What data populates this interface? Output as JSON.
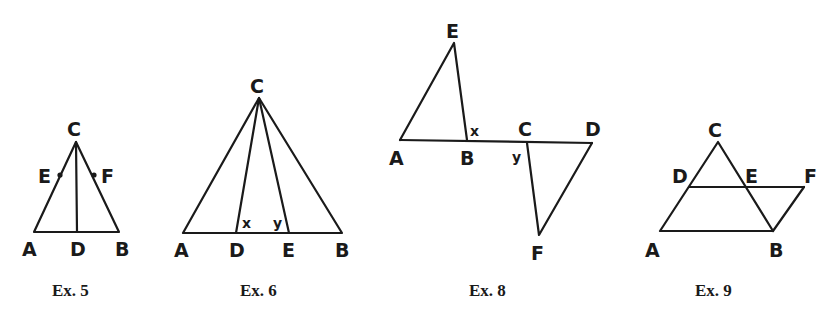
{
  "figures": [
    {
      "caption": "Ex. 5",
      "points": {
        "A": "A",
        "B": "B",
        "C": "C",
        "D": "D",
        "E": "E",
        "F": "F"
      },
      "description": "Isosceles triangle ABC with altitude CD; E and F marked on sides AC and BC"
    },
    {
      "caption": "Ex. 6",
      "points": {
        "A": "A",
        "B": "B",
        "C": "C",
        "D": "D",
        "E": "E"
      },
      "angles": {
        "x": "x",
        "y": "y"
      },
      "description": "Triangle ABC with cevians CD and CE; angles x at D and y at E"
    },
    {
      "caption": "Ex. 8",
      "points": {
        "A": "A",
        "B": "B",
        "C": "C",
        "D": "D",
        "E": "E",
        "F": "F"
      },
      "angles": {
        "x": "x",
        "y": "y"
      },
      "description": "Line ABCD with triangle ABE above and triangle CDF below; angle x at B, angle y at C"
    },
    {
      "caption": "Ex. 9",
      "points": {
        "A": "A",
        "B": "B",
        "C": "C",
        "D": "D",
        "E": "E",
        "F": "F"
      },
      "description": "Triangle ABC with DF parallel to AB crossing CB at E; BF joined"
    }
  ]
}
